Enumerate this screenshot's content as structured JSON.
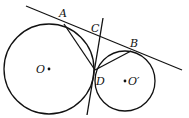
{
  "diagram": {
    "type": "geometry",
    "points": {
      "A": {
        "label": "A",
        "x": 64,
        "y": 24
      },
      "B": {
        "label": "B",
        "x": 131,
        "y": 51
      },
      "C": {
        "label": "C",
        "x": 100,
        "y": 38
      },
      "D": {
        "label": "D",
        "x": 95,
        "y": 70
      },
      "O": {
        "label": "O",
        "x": 49,
        "y": 69
      },
      "O_prime": {
        "label": "O′",
        "x": 125,
        "y": 81
      }
    },
    "circles": [
      {
        "name": "circle-O",
        "center": "O",
        "cx": 49,
        "cy": 69,
        "r": 45
      },
      {
        "name": "circle-O-prime",
        "center": "O′",
        "cx": 125,
        "cy": 81,
        "r": 30
      }
    ],
    "lines": [
      {
        "name": "tangent-AB",
        "from": [
          26,
          6
        ],
        "to": [
          182,
          70
        ]
      },
      {
        "name": "tangent-CD",
        "from": [
          103,
          18
        ],
        "to": [
          87,
          115
        ]
      },
      {
        "name": "segment-AD",
        "from": "A",
        "to": "D"
      },
      {
        "name": "segment-BD",
        "from": "B",
        "to": "D"
      }
    ],
    "labels": {
      "A": "A",
      "B": "B",
      "C": "C",
      "D": "D",
      "O": "O",
      "O_prime": "O′"
    }
  }
}
